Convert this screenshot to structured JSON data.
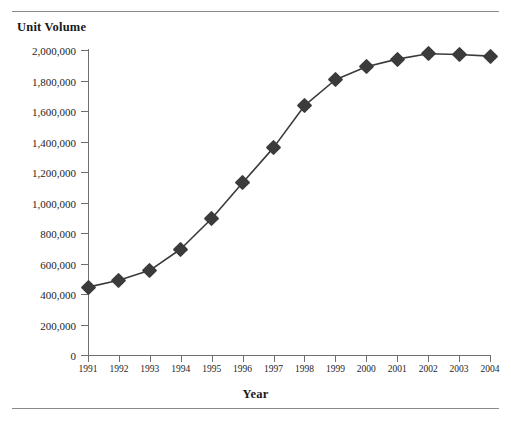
{
  "page": {
    "running_head": "",
    "y_axis_title": "Unit Volume",
    "x_axis_title": "Year"
  },
  "colors": {
    "series": "#3b3b3b",
    "axis": "#6f6f6f",
    "rule": "#8a8a8a",
    "text": "#1a1a1a"
  },
  "chart_data": {
    "type": "line",
    "title": "",
    "xlabel": "Year",
    "ylabel": "Unit Volume",
    "categories": [
      "1991",
      "1992",
      "1993",
      "1994",
      "1995",
      "1996",
      "1997",
      "1998",
      "1999",
      "2000",
      "2001",
      "2002",
      "2003",
      "2004"
    ],
    "values": [
      445000,
      490000,
      555000,
      695000,
      895000,
      1130000,
      1360000,
      1635000,
      1805000,
      1890000,
      1940000,
      1975000,
      1970000,
      1960000
    ],
    "series": [
      {
        "name": "Unit Volume",
        "values": [
          445000,
          490000,
          555000,
          695000,
          895000,
          1130000,
          1360000,
          1635000,
          1805000,
          1890000,
          1940000,
          1975000,
          1970000,
          1960000
        ]
      }
    ],
    "ylim": [
      0,
      2000000
    ],
    "ytick_labels": [
      "0",
      "200,000",
      "400,000",
      "600,000",
      "800,000",
      "1,000,000",
      "1,200,000",
      "1,400,000",
      "1,600,000",
      "1,800,000",
      "2,000,000"
    ],
    "ytick_values": [
      0,
      200000,
      400000,
      600000,
      800000,
      1000000,
      1200000,
      1400000,
      1600000,
      1800000,
      2000000
    ],
    "grid": false,
    "legend": "none",
    "marker": "diamond"
  }
}
